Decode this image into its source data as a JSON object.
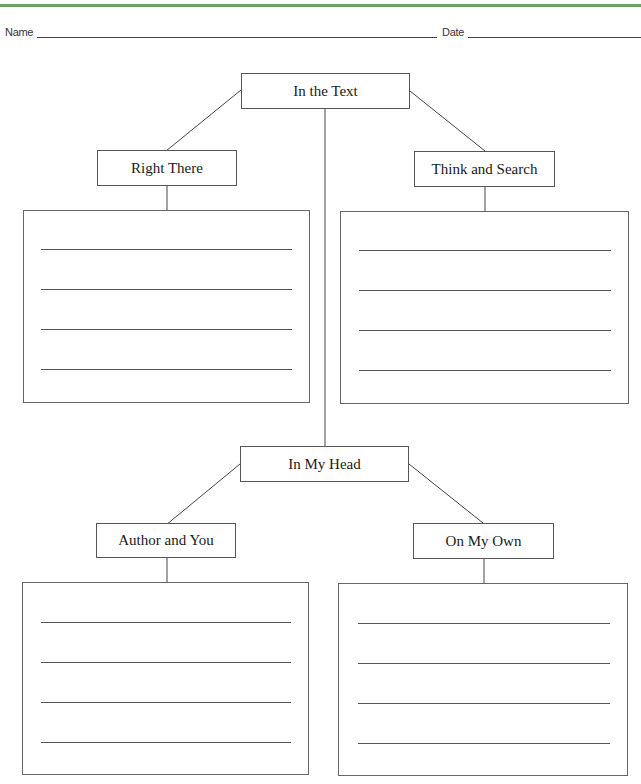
{
  "header": {
    "name_label": "Name",
    "name_value": "",
    "date_label": "Date",
    "date_value": "",
    "accent_color": "#6e9f6a"
  },
  "diagram": {
    "top_root": {
      "label": "In the Text"
    },
    "top_left": {
      "label": "Right There",
      "answer_lines": [
        "",
        "",
        "",
        ""
      ]
    },
    "top_right": {
      "label": "Think and Search",
      "answer_lines": [
        "",
        "",
        "",
        ""
      ]
    },
    "bottom_root": {
      "label": "In My Head"
    },
    "bottom_left": {
      "label": "Author and You",
      "answer_lines": [
        "",
        "",
        "",
        ""
      ]
    },
    "bottom_right": {
      "label": "On My Own",
      "answer_lines": [
        "",
        "",
        "",
        ""
      ]
    }
  }
}
